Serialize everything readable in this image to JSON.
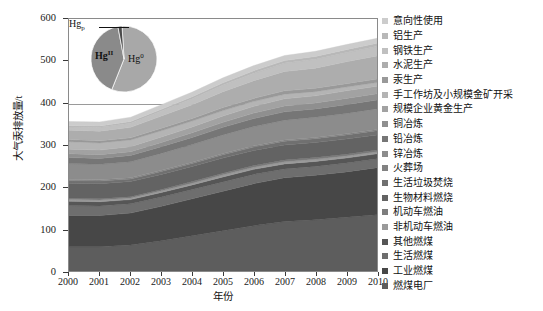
{
  "chart_data": {
    "type": "area",
    "stacked": true,
    "title": "",
    "xlabel": "年份",
    "ylabel": "大气汞排放量/t",
    "xlim": [
      2000,
      2010
    ],
    "ylim": [
      0,
      600
    ],
    "ytick_labels": [
      "0",
      "100",
      "200",
      "300",
      "400",
      "500",
      "600"
    ],
    "ytick_values": [
      0,
      100,
      200,
      300,
      400,
      500,
      600
    ],
    "grid": "horizontal",
    "legend_position": "right",
    "categories": [
      2000,
      2001,
      2002,
      2003,
      2004,
      2005,
      2006,
      2007,
      2008,
      2009,
      2010
    ],
    "xtick_labels": [
      "2000",
      "2001",
      "2002",
      "2003",
      "2004",
      "2005",
      "2006",
      "2007",
      "2008",
      "2009",
      "2010"
    ],
    "series": [
      {
        "name": "燃煤电厂",
        "color": "#5d5d5d",
        "values": [
          58,
          58,
          62,
          72,
          84,
          96,
          108,
          118,
          122,
          128,
          134
        ]
      },
      {
        "name": "工业燃煤",
        "color": "#474747",
        "values": [
          74,
          74,
          76,
          82,
          88,
          94,
          100,
          104,
          106,
          108,
          112
        ]
      },
      {
        "name": "生活燃煤",
        "color": "#6e6e6e",
        "values": [
          24,
          23,
          22,
          22,
          22,
          22,
          22,
          21,
          21,
          21,
          21
        ]
      },
      {
        "name": "其他燃煤",
        "color": "#565656",
        "values": [
          10,
          10,
          10,
          11,
          11,
          12,
          12,
          12,
          12,
          12,
          12
        ]
      },
      {
        "name": "非机动车燃油",
        "color": "#9a9a9a",
        "values": [
          4,
          4,
          4,
          4,
          4,
          5,
          5,
          5,
          5,
          5,
          5
        ]
      },
      {
        "name": "机动车燃油",
        "color": "#7d7d7d",
        "values": [
          3,
          3,
          3,
          3,
          4,
          4,
          4,
          4,
          4,
          4,
          4
        ]
      },
      {
        "name": "生物材料燃烧",
        "color": "#636363",
        "values": [
          36,
          36,
          36,
          36,
          36,
          36,
          36,
          36,
          36,
          36,
          36
        ]
      },
      {
        "name": "生活垃圾焚烧",
        "color": "#707070",
        "values": [
          6,
          6,
          6,
          7,
          7,
          8,
          8,
          9,
          9,
          10,
          10
        ]
      },
      {
        "name": "火葬场",
        "color": "#828282",
        "values": [
          3,
          3,
          3,
          3,
          3,
          3,
          3,
          3,
          3,
          3,
          3
        ]
      },
      {
        "name": "锌冶炼",
        "color": "#8c8c8c",
        "values": [
          38,
          37,
          38,
          40,
          42,
          44,
          46,
          47,
          48,
          48,
          49
        ]
      },
      {
        "name": "铅冶炼",
        "color": "#767676",
        "values": [
          14,
          14,
          15,
          16,
          17,
          18,
          19,
          20,
          20,
          21,
          21
        ]
      },
      {
        "name": "铜冶炼",
        "color": "#8f8f8f",
        "values": [
          9,
          9,
          9,
          10,
          11,
          12,
          13,
          14,
          14,
          15,
          15
        ]
      },
      {
        "name": "规模企业黄金生产",
        "color": "#a2a2a2",
        "values": [
          11,
          11,
          12,
          13,
          14,
          15,
          16,
          17,
          17,
          18,
          18
        ]
      },
      {
        "name": "手工作坊及小规模金矿开采",
        "color": "#b4b4b4",
        "values": [
          18,
          17,
          16,
          15,
          14,
          13,
          12,
          11,
          10,
          9,
          9
        ]
      },
      {
        "name": "汞生产",
        "color": "#999999",
        "values": [
          5,
          5,
          5,
          6,
          6,
          7,
          7,
          8,
          8,
          8,
          8
        ]
      },
      {
        "name": "水泥生产",
        "color": "#adadad",
        "values": [
          22,
          23,
          25,
          29,
          33,
          38,
          42,
          46,
          48,
          52,
          55
        ]
      },
      {
        "name": "钢铁生产",
        "color": "#c0c0c0",
        "values": [
          8,
          9,
          10,
          12,
          14,
          16,
          18,
          20,
          21,
          22,
          23
        ]
      },
      {
        "name": "铝生产",
        "color": "#b8b8b8",
        "values": [
          3,
          3,
          4,
          4,
          5,
          5,
          6,
          6,
          7,
          7,
          7
        ]
      },
      {
        "name": "意向性使用",
        "color": "#cccccc",
        "values": [
          10,
          10,
          10,
          11,
          11,
          12,
          12,
          12,
          12,
          12,
          12
        ]
      }
    ],
    "legend_order": [
      {
        "label": "意向性使用",
        "color": "#cccccc"
      },
      {
        "label": "铝生产",
        "color": "#b8b8b8"
      },
      {
        "label": "钢铁生产",
        "color": "#c0c0c0"
      },
      {
        "label": "水泥生产",
        "color": "#adadad"
      },
      {
        "label": "汞生产",
        "color": "#999999"
      },
      {
        "label": "手工作坊及小规模金矿开采",
        "color": "#b4b4b4"
      },
      {
        "label": "规模企业黄金生产",
        "color": "#a2a2a2"
      },
      {
        "label": "铜冶炼",
        "color": "#8f8f8f"
      },
      {
        "label": "铅冶炼",
        "color": "#767676"
      },
      {
        "label": "锌冶炼",
        "color": "#8c8c8c"
      },
      {
        "label": "火葬场",
        "color": "#828282"
      },
      {
        "label": "生活垃圾焚烧",
        "color": "#707070"
      },
      {
        "label": "生物材料燃烧",
        "color": "#636363"
      },
      {
        "label": "机动车燃油",
        "color": "#7d7d7d"
      },
      {
        "label": "非机动车燃油",
        "color": "#9a9a9a"
      },
      {
        "label": "其他燃煤",
        "color": "#565656"
      },
      {
        "label": "生活燃煤",
        "color": "#6e6e6e"
      },
      {
        "label": "工业燃煤",
        "color": "#474747"
      },
      {
        "label": "燃煤电厂",
        "color": "#5d5d5d"
      }
    ],
    "inset_pie": {
      "type": "pie",
      "labels": [
        "Hg⁰",
        "HgII",
        "Hgp"
      ],
      "label_html": [
        "Hg<sup>0</sup>",
        "Hg<sup>II</sup>",
        "Hg<sub>p</sub>"
      ],
      "values": [
        57,
        41,
        2
      ],
      "colors": [
        "#a8a8a8",
        "#8a8a8a",
        "#4a4a4a"
      ]
    }
  }
}
